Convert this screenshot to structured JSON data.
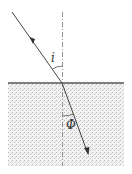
{
  "diagram": {
    "labels": {
      "incidence_angle": "i",
      "refraction_angle": "Φ"
    },
    "colors": {
      "line": "#444444",
      "medium": "#e6e6e6"
    }
  }
}
